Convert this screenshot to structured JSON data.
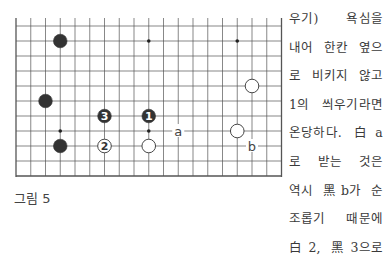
{
  "figure": {
    "caption": "그림 5",
    "board": {
      "columns": 19,
      "rows": 11,
      "origin_x": 16,
      "origin_y": 26,
      "spacing_x": 14.75,
      "spacing_y": 15,
      "top_open": true,
      "star_points": [
        {
          "col": 9,
          "row": 1
        },
        {
          "col": 15,
          "row": 1
        },
        {
          "col": 3,
          "row": 7
        },
        {
          "col": 9,
          "row": 7
        }
      ],
      "stones": [
        {
          "color": "black",
          "col": 3,
          "row": 1,
          "label": ""
        },
        {
          "color": "white",
          "col": 16,
          "row": 4,
          "label": ""
        },
        {
          "color": "black",
          "col": 2,
          "row": 5,
          "label": ""
        },
        {
          "color": "black",
          "col": 6,
          "row": 6,
          "label": "3"
        },
        {
          "color": "black",
          "col": 9,
          "row": 6,
          "label": "1"
        },
        {
          "color": "white",
          "col": 15,
          "row": 7,
          "label": ""
        },
        {
          "color": "black",
          "col": 3,
          "row": 8,
          "label": ""
        },
        {
          "color": "white",
          "col": 6,
          "row": 8,
          "label": "2"
        },
        {
          "color": "white",
          "col": 9,
          "row": 8,
          "label": ""
        }
      ],
      "markers": [
        {
          "label": "a",
          "col": 11,
          "row": 7
        },
        {
          "label": "b",
          "col": 16,
          "row": 8
        }
      ]
    }
  },
  "body_text": {
    "lines": [
      "우기) 욕심을",
      "내어 한칸 옆으",
      "로 비키지 않고",
      "1의 씌우기라면",
      "온당하다. 白a",
      "로 받는 것은",
      "역시 黑b가 순",
      "조롭기 때문에",
      "白2, 黑3으로"
    ]
  },
  "colors": {
    "line": "#555555",
    "black_stone": "#333333",
    "white_stone": "#ffffff"
  }
}
